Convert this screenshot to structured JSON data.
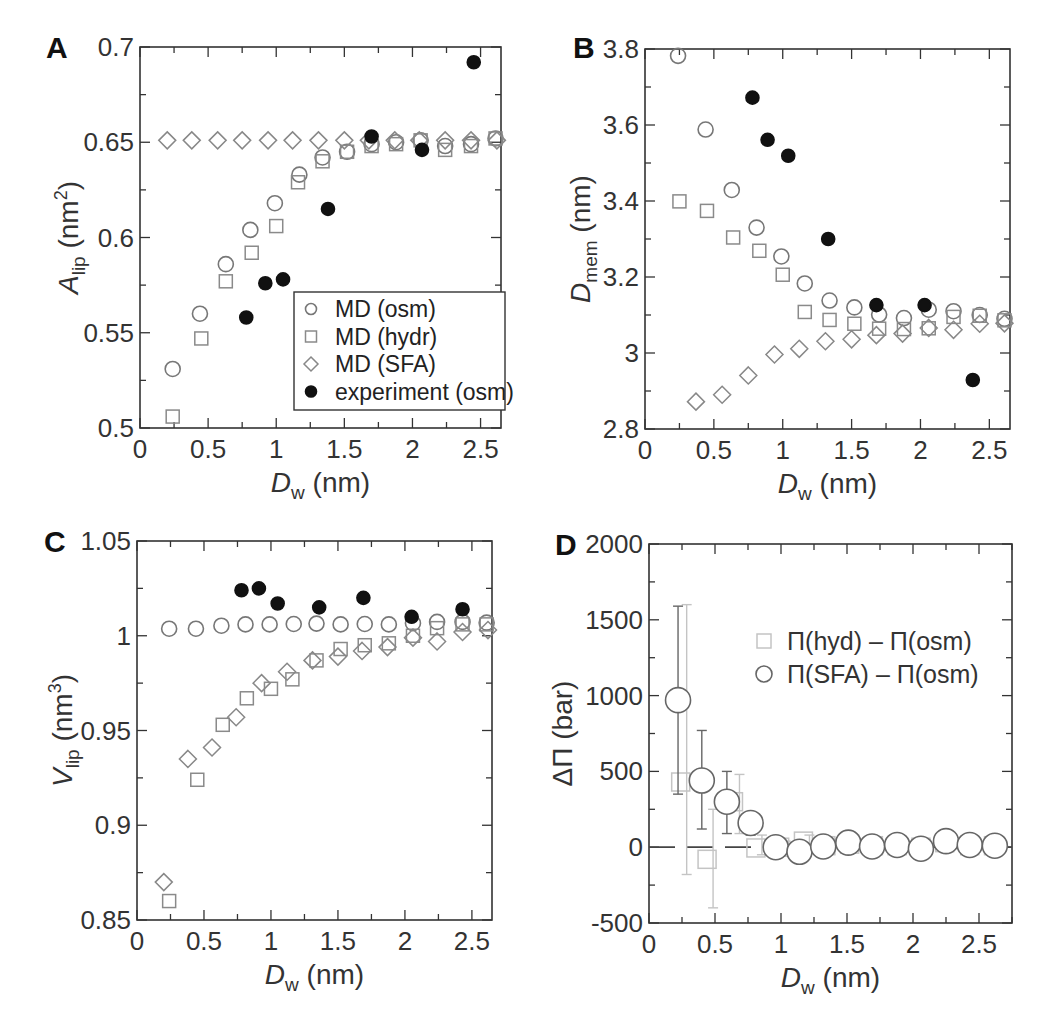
{
  "figure": {
    "panels": [
      "A",
      "B",
      "C",
      "D"
    ]
  },
  "colors": {
    "osm": "#777777",
    "hydr": "#8a8a8a",
    "sfa": "#888888",
    "experiment": "#111111",
    "axis": "#333333",
    "hyd_diff": "#c4c4c4",
    "sfa_diff": "#666666"
  },
  "chart_data": [
    {
      "panel": "A",
      "type": "scatter",
      "title": "",
      "xlabel": "D_w (nm)",
      "ylabel": "A_lip (nm^2)",
      "xlim": [
        0,
        2.65
      ],
      "ylim": [
        0.5,
        0.7
      ],
      "xticks": [
        0,
        0.5,
        1,
        1.5,
        2,
        2.5
      ],
      "xtick_labels": [
        "0",
        "0.5",
        "1",
        "1.5",
        "2",
        "2.5"
      ],
      "yticks": [
        0.5,
        0.55,
        0.6,
        0.65,
        0.7
      ],
      "ytick_labels": [
        "0.5",
        "0.55",
        "0.6",
        "0.65",
        "0.7"
      ],
      "grid": false,
      "legend_position": "lower right",
      "legend": [
        "MD (osm)",
        "MD (hydr)",
        "MD (SFA)",
        "experiment (osm)"
      ],
      "series": [
        {
          "name": "MD (osm)",
          "marker": "circle",
          "x": [
            0.24,
            0.44,
            0.63,
            0.81,
            0.99,
            1.17,
            1.34,
            1.52,
            1.7,
            1.88,
            2.06,
            2.24,
            2.43,
            2.61
          ],
          "y": [
            0.531,
            0.56,
            0.586,
            0.604,
            0.618,
            0.633,
            0.642,
            0.645,
            0.649,
            0.65,
            0.651,
            0.648,
            0.649,
            0.652
          ]
        },
        {
          "name": "MD (hydr)",
          "marker": "square",
          "x": [
            0.24,
            0.45,
            0.63,
            0.82,
            1.0,
            1.16,
            1.34,
            1.52,
            1.7,
            1.88,
            2.06,
            2.24,
            2.43,
            2.61
          ],
          "y": [
            0.506,
            0.547,
            0.577,
            0.592,
            0.606,
            0.629,
            0.64,
            0.645,
            0.648,
            0.649,
            0.651,
            0.646,
            0.648,
            0.652
          ]
        },
        {
          "name": "MD (SFA)",
          "marker": "diamond",
          "x": [
            0.2,
            0.38,
            0.57,
            0.75,
            0.94,
            1.12,
            1.31,
            1.5,
            1.68,
            1.87,
            2.05,
            2.24,
            2.43,
            2.62
          ],
          "y": [
            0.651,
            0.651,
            0.651,
            0.651,
            0.651,
            0.651,
            0.651,
            0.651,
            0.651,
            0.651,
            0.651,
            0.651,
            0.651,
            0.651
          ]
        },
        {
          "name": "experiment (osm)",
          "marker": "filled-circle",
          "x": [
            0.78,
            0.92,
            1.05,
            1.38,
            1.7,
            2.07,
            2.45
          ],
          "y": [
            0.558,
            0.576,
            0.578,
            0.615,
            0.653,
            0.646,
            0.692
          ]
        }
      ]
    },
    {
      "panel": "B",
      "type": "scatter",
      "title": "",
      "xlabel": "D_w (nm)",
      "ylabel": "D_mem (nm)",
      "xlim": [
        0,
        2.65
      ],
      "ylim": [
        2.8,
        3.8
      ],
      "xticks": [
        0,
        0.5,
        1,
        1.5,
        2,
        2.5
      ],
      "xtick_labels": [
        "0",
        "0.5",
        "1",
        "1.5",
        "2",
        "2.5"
      ],
      "yticks": [
        2.8,
        3.0,
        3.2,
        3.4,
        3.6,
        3.8
      ],
      "ytick_labels": [
        "2.8",
        "3",
        "3.2",
        "3.4",
        "3.6",
        "3.8"
      ],
      "grid": false,
      "series": [
        {
          "name": "MD (osm)",
          "marker": "circle",
          "x": [
            0.24,
            0.44,
            0.63,
            0.81,
            0.99,
            1.16,
            1.34,
            1.52,
            1.7,
            1.88,
            2.06,
            2.24,
            2.43,
            2.61
          ],
          "y": [
            3.782,
            3.588,
            3.429,
            3.33,
            3.254,
            3.183,
            3.138,
            3.12,
            3.101,
            3.092,
            3.114,
            3.11,
            3.1,
            3.09
          ]
        },
        {
          "name": "MD (hydr)",
          "marker": "square",
          "x": [
            0.25,
            0.45,
            0.64,
            0.83,
            1.0,
            1.16,
            1.34,
            1.52,
            1.7,
            1.88,
            2.06,
            2.24,
            2.43,
            2.61
          ],
          "y": [
            3.399,
            3.374,
            3.304,
            3.269,
            3.206,
            3.108,
            3.087,
            3.077,
            3.064,
            3.063,
            3.065,
            3.095,
            3.098,
            3.086
          ]
        },
        {
          "name": "MD (SFA)",
          "marker": "diamond",
          "x": [
            0.37,
            0.56,
            0.75,
            0.94,
            1.12,
            1.31,
            1.5,
            1.68,
            1.87,
            2.06,
            2.24,
            2.43,
            2.61
          ],
          "y": [
            2.872,
            2.89,
            2.941,
            2.996,
            3.011,
            3.031,
            3.036,
            3.047,
            3.051,
            3.066,
            3.061,
            3.077,
            3.078
          ]
        },
        {
          "name": "experiment (osm)",
          "marker": "filled-circle",
          "x": [
            0.78,
            0.89,
            1.04,
            1.33,
            1.68,
            2.03,
            2.38
          ],
          "y": [
            3.672,
            3.561,
            3.519,
            3.3,
            3.126,
            3.126,
            2.929
          ]
        }
      ]
    },
    {
      "panel": "C",
      "type": "scatter",
      "title": "",
      "xlabel": "D_w (nm)",
      "ylabel": "V_lip (nm^3)",
      "xlim": [
        0,
        2.65
      ],
      "ylim": [
        0.85,
        1.05
      ],
      "xticks": [
        0,
        0.5,
        1,
        1.5,
        2,
        2.5
      ],
      "xtick_labels": [
        "0",
        "0.5",
        "1",
        "1.5",
        "2",
        "2.5"
      ],
      "yticks": [
        0.85,
        0.9,
        0.95,
        1.0,
        1.05
      ],
      "ytick_labels": [
        "0.85",
        "0.9",
        "0.95",
        "1",
        "1.05"
      ],
      "grid": false,
      "series": [
        {
          "name": "MD (osm)",
          "marker": "circle",
          "x": [
            0.24,
            0.44,
            0.63,
            0.81,
            0.99,
            1.17,
            1.34,
            1.52,
            1.7,
            1.88,
            2.06,
            2.24,
            2.43,
            2.61
          ],
          "y": [
            1.0037,
            1.0037,
            1.0053,
            1.006,
            1.006,
            1.0062,
            1.0064,
            1.006,
            1.0062,
            1.006,
            1.0066,
            1.0073,
            1.0073,
            1.0069
          ]
        },
        {
          "name": "MD (hydr)",
          "marker": "square",
          "x": [
            0.24,
            0.45,
            0.64,
            0.82,
            1.0,
            1.16,
            1.34,
            1.52,
            1.7,
            1.88,
            2.06,
            2.24,
            2.43,
            2.61
          ],
          "y": [
            0.86,
            0.924,
            0.953,
            0.967,
            0.972,
            0.977,
            0.987,
            0.993,
            0.995,
            0.996,
            1.0,
            1.004,
            1.006,
            1.006
          ]
        },
        {
          "name": "MD (SFA)",
          "marker": "diamond",
          "x": [
            0.2,
            0.38,
            0.56,
            0.74,
            0.93,
            1.12,
            1.31,
            1.5,
            1.68,
            1.87,
            2.06,
            2.24,
            2.43,
            2.62
          ],
          "y": [
            0.87,
            0.935,
            0.941,
            0.957,
            0.975,
            0.981,
            0.987,
            0.989,
            0.992,
            0.994,
            0.999,
            0.997,
            1.002,
            1.003
          ]
        },
        {
          "name": "experiment (osm)",
          "marker": "filled-circle",
          "x": [
            0.78,
            0.91,
            1.05,
            1.36,
            1.69,
            2.05,
            2.43
          ],
          "y": [
            1.024,
            1.025,
            1.017,
            1.015,
            1.02,
            1.01,
            1.014
          ]
        }
      ]
    },
    {
      "panel": "D",
      "type": "scatter",
      "title": "",
      "xlabel": "D_w (nm)",
      "ylabel": "ΔΠ (bar)",
      "xlim": [
        0,
        2.75
      ],
      "ylim": [
        -500,
        2000
      ],
      "xticks": [
        0,
        0.5,
        1,
        1.5,
        2,
        2.5
      ],
      "xtick_labels": [
        "0",
        "0.5",
        "1",
        "1.5",
        "2",
        "2.5"
      ],
      "yticks": [
        -500,
        0,
        500,
        1000,
        1500,
        2000
      ],
      "ytick_labels": [
        "-500",
        "0",
        "500",
        "1000",
        "1500",
        "2000"
      ],
      "grid": false,
      "reference_line": {
        "y": 0,
        "style": "dashed"
      },
      "legend_position": "upper right",
      "legend": [
        "Π(hyd) – Π(osm)",
        "Π(SFA) – Π(osm)"
      ],
      "series": [
        {
          "name": "Π(hyd) – Π(osm)",
          "marker": "square",
          "x": [
            0.24,
            0.44,
            0.64,
            0.81,
            0.99,
            1.17,
            1.34,
            1.52,
            1.7,
            1.88,
            2.06,
            2.24,
            2.43,
            2.61
          ],
          "y": [
            430,
            -80,
            300,
            -5,
            0,
            40,
            10,
            20,
            10,
            10,
            0,
            30,
            10,
            10
          ],
          "yerr_low": [
            -180,
            -400,
            90,
            -50,
            -30,
            0,
            -15,
            -10,
            -15,
            -15,
            -30,
            0,
            -15,
            -15
          ],
          "yerr_high": [
            1600,
            250,
            480,
            80,
            40,
            80,
            40,
            50,
            40,
            40,
            30,
            60,
            40,
            40
          ]
        },
        {
          "name": "Π(SFA) – Π(osm)",
          "marker": "circle",
          "x": [
            0.22,
            0.4,
            0.59,
            0.77,
            0.96,
            1.14,
            1.32,
            1.51,
            1.69,
            1.88,
            2.06,
            2.25,
            2.43,
            2.62
          ],
          "y": [
            970,
            440,
            300,
            160,
            0,
            -30,
            5,
            30,
            5,
            15,
            -10,
            40,
            15,
            10
          ],
          "yerr_low": [
            350,
            120,
            90,
            80,
            0,
            -30,
            5,
            30,
            5,
            15,
            -10,
            40,
            15,
            10
          ],
          "yerr_high": [
            1590,
            770,
            500,
            230,
            0,
            -30,
            5,
            30,
            5,
            15,
            -10,
            40,
            15,
            10
          ]
        }
      ]
    }
  ]
}
